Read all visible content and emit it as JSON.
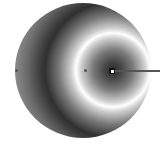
{
  "widget": {
    "type": "radial-gradient-editor",
    "gradient": {
      "spread": "reflect",
      "stops": [
        {
          "offset": 0,
          "color": "#2a2a2a"
        },
        {
          "offset": 1,
          "color": "#ffffff"
        }
      ]
    },
    "colors": {
      "handle": "#555555",
      "focus": "#111111",
      "focus_inner": "#ffffff",
      "radius_line": "#555555"
    },
    "handles": [
      "outer-left-handle",
      "inner-left-handle",
      "focus-handle",
      "radius-handle"
    ]
  }
}
